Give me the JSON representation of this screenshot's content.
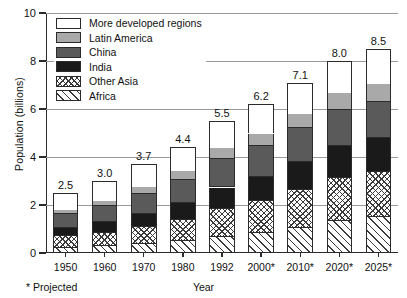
{
  "chart_data": {
    "type": "bar",
    "subtype": "stacked",
    "title": "",
    "xlabel": "Year",
    "ylabel": "Population (billions)",
    "ylim": [
      0,
      10
    ],
    "yticks": [
      0,
      2,
      4,
      6,
      8,
      10
    ],
    "ytick_labels": [
      "0",
      "2",
      "4",
      "6",
      "8",
      "10"
    ],
    "grid": "horizontal",
    "legend_position": "top-left",
    "footnote": "* Projected",
    "categories": [
      "1950",
      "1960",
      "1970",
      "1980",
      "1992",
      "2000*",
      "2010*",
      "2020*",
      "2025*"
    ],
    "totals": [
      2.5,
      3.0,
      3.7,
      4.4,
      5.5,
      6.2,
      7.1,
      8.0,
      8.5
    ],
    "total_labels": [
      "2.5",
      "3.0",
      "3.7",
      "4.4",
      "5.5",
      "6.2",
      "7.1",
      "8.0",
      "8.5"
    ],
    "series": [
      {
        "name": "Africa",
        "fill": "diag",
        "values": [
          0.22,
          0.28,
          0.36,
          0.48,
          0.68,
          0.83,
          1.05,
          1.33,
          1.48
        ]
      },
      {
        "name": "Other Asia",
        "fill": "cross",
        "values": [
          0.47,
          0.57,
          0.72,
          0.9,
          1.17,
          1.35,
          1.58,
          1.8,
          1.9
        ]
      },
      {
        "name": "India",
        "fill": "black",
        "values": [
          0.36,
          0.44,
          0.55,
          0.69,
          0.88,
          1.0,
          1.17,
          1.33,
          1.4
        ]
      },
      {
        "name": "China",
        "fill": "dkgray",
        "values": [
          0.56,
          0.67,
          0.83,
          0.99,
          1.18,
          1.28,
          1.4,
          1.49,
          1.52
        ]
      },
      {
        "name": "Latin America",
        "fill": "ltgray",
        "values": [
          0.17,
          0.22,
          0.29,
          0.36,
          0.46,
          0.52,
          0.61,
          0.7,
          0.74
        ]
      },
      {
        "name": "More developed regions",
        "fill": "white",
        "values": [
          0.72,
          0.82,
          0.95,
          0.98,
          1.13,
          1.22,
          1.29,
          1.35,
          1.46
        ]
      }
    ],
    "legend": [
      {
        "label": "More developed regions",
        "fill": "white"
      },
      {
        "label": "Latin America",
        "fill": "ltgray"
      },
      {
        "label": "China",
        "fill": "dkgray"
      },
      {
        "label": "India",
        "fill": "black"
      },
      {
        "label": "Other Asia",
        "fill": "cross"
      },
      {
        "label": "Africa",
        "fill": "diag"
      }
    ],
    "colors": {
      "white": "#ffffff",
      "ltgray": "#a9a9a9",
      "dkgray": "#5a5a5a",
      "black": "#1a1a1a",
      "outline": "#2b2b2b",
      "gridline": "#9a9a9a"
    }
  }
}
